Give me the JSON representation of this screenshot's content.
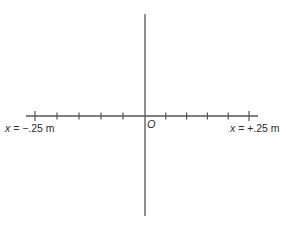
{
  "diagram": {
    "type": "number-line-axes",
    "axis_color": "#555555",
    "x_axis": {
      "variable": "x",
      "min_label": "x = −.25 m",
      "max_label": "x = +.25 m",
      "min_value": -0.25,
      "max_value": 0.25,
      "unit": "m",
      "tick_step": 0.05,
      "tick_count_per_side": 5
    },
    "y_axis": {
      "label": ""
    },
    "origin_label": "O"
  }
}
